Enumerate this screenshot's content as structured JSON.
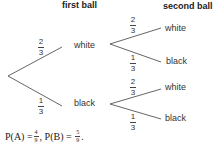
{
  "headers": {
    "first": "first ball",
    "second": "second ball"
  },
  "tree": {
    "level1": [
      {
        "label": "white",
        "prob": {
          "num": "2",
          "den": "3"
        }
      },
      {
        "label": "black",
        "prob": {
          "num": "1",
          "den": "3"
        }
      }
    ],
    "level2_white": [
      {
        "label": "white",
        "prob": {
          "num": "2",
          "den": "3"
        }
      },
      {
        "label": "black",
        "prob": {
          "num": "1",
          "den": "3"
        }
      }
    ],
    "level2_black": [
      {
        "label": "white",
        "prob": {
          "num": "2",
          "den": "3"
        }
      },
      {
        "label": "black",
        "prob": {
          "num": "1",
          "den": "3"
        }
      }
    ]
  },
  "formula": {
    "pa_label": "P(A) = ",
    "pa": {
      "num": "4",
      "den": "9"
    },
    "sep": ", P(B) = ",
    "pb": {
      "num": "5",
      "den": "9"
    }
  },
  "colors": {
    "line": "#555555",
    "text": "#333333"
  }
}
